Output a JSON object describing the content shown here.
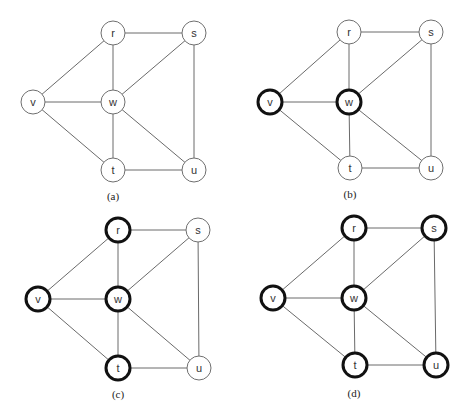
{
  "figure": {
    "colors": {
      "edge": "#6a6a6a",
      "node_stroke_normal": "#6f6f6f",
      "node_stroke_bold": "#111111",
      "node_fill": "#ffffff",
      "background": "#ffffff"
    },
    "node_radius": 12,
    "edges": [
      [
        "r",
        "s"
      ],
      [
        "r",
        "v"
      ],
      [
        "r",
        "w"
      ],
      [
        "s",
        "w"
      ],
      [
        "s",
        "u"
      ],
      [
        "v",
        "w"
      ],
      [
        "v",
        "t"
      ],
      [
        "w",
        "t"
      ],
      [
        "w",
        "u"
      ],
      [
        "t",
        "u"
      ]
    ],
    "panels": [
      {
        "id": "a",
        "caption": "(a)",
        "caption_pos": [
          113,
          196
        ],
        "nodes": {
          "r": {
            "label": "r",
            "x": 113,
            "y": 33,
            "bold": false
          },
          "s": {
            "label": "s",
            "x": 194,
            "y": 33,
            "bold": false
          },
          "v": {
            "label": "v",
            "x": 33,
            "y": 102,
            "bold": false
          },
          "w": {
            "label": "w",
            "x": 113,
            "y": 102,
            "bold": false
          },
          "t": {
            "label": "t",
            "x": 113,
            "y": 170,
            "bold": false
          },
          "u": {
            "label": "u",
            "x": 194,
            "y": 170,
            "bold": false
          }
        }
      },
      {
        "id": "b",
        "caption": "(b)",
        "caption_pos": [
          350,
          194
        ],
        "nodes": {
          "r": {
            "label": "r",
            "x": 349,
            "y": 32,
            "bold": false
          },
          "s": {
            "label": "s",
            "x": 431,
            "y": 32,
            "bold": false
          },
          "v": {
            "label": "v",
            "x": 270,
            "y": 102,
            "bold": true
          },
          "w": {
            "label": "w",
            "x": 349,
            "y": 102,
            "bold": true
          },
          "t": {
            "label": "t",
            "x": 350,
            "y": 168,
            "bold": false
          },
          "u": {
            "label": "u",
            "x": 431,
            "y": 168,
            "bold": false
          }
        }
      },
      {
        "id": "c",
        "caption": "(c)",
        "caption_pos": [
          118,
          394
        ],
        "nodes": {
          "r": {
            "label": "r",
            "x": 118,
            "y": 230,
            "bold": true
          },
          "s": {
            "label": "s",
            "x": 198,
            "y": 230,
            "bold": false
          },
          "v": {
            "label": "v",
            "x": 38,
            "y": 299,
            "bold": true
          },
          "w": {
            "label": "w",
            "x": 118,
            "y": 299,
            "bold": true
          },
          "t": {
            "label": "t",
            "x": 118,
            "y": 368,
            "bold": true
          },
          "u": {
            "label": "u",
            "x": 199,
            "y": 368,
            "bold": false
          }
        }
      },
      {
        "id": "d",
        "caption": "(d)",
        "caption_pos": [
          354,
          393
        ],
        "nodes": {
          "r": {
            "label": "r",
            "x": 354,
            "y": 228,
            "bold": true
          },
          "s": {
            "label": "s",
            "x": 434,
            "y": 228,
            "bold": true
          },
          "v": {
            "label": "v",
            "x": 273,
            "y": 298,
            "bold": true
          },
          "w": {
            "label": "w",
            "x": 354,
            "y": 298,
            "bold": true
          },
          "t": {
            "label": "t",
            "x": 355,
            "y": 365,
            "bold": true
          },
          "u": {
            "label": "u",
            "x": 436,
            "y": 365,
            "bold": true
          }
        }
      }
    ]
  }
}
